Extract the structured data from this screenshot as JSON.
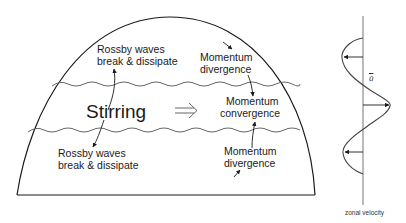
{
  "diagram": {
    "title": "",
    "left_panel": {
      "shape": "hemispherical dome (atmosphere cross-section)",
      "center_label": "Stirring",
      "center_arrow": "double-right-arrow",
      "labels": {
        "rossby_top": [
          "Rossby waves",
          "break & dissipate"
        ],
        "rossby_bottom": [
          "Rossby waves",
          "break & dissipate"
        ],
        "momentum_div_top": [
          "Momentum",
          "divergence"
        ],
        "momentum_conv": [
          "Momentum",
          "convergence"
        ],
        "momentum_div_bottom": [
          "Momentum",
          "divergence"
        ]
      },
      "wave_lines": [
        "upper wavy boundary",
        "lower wavy boundary"
      ]
    },
    "right_panel": {
      "curve_label": "ū",
      "axis_label": "zonal velocity",
      "arrows": [
        {
          "position": "upper",
          "direction": "left"
        },
        {
          "position": "middle",
          "direction": "right"
        },
        {
          "position": "lower",
          "direction": "left"
        }
      ]
    },
    "colors": {
      "line": "#1a1a1a",
      "wave": "#555555",
      "background": "#ffffff"
    }
  }
}
